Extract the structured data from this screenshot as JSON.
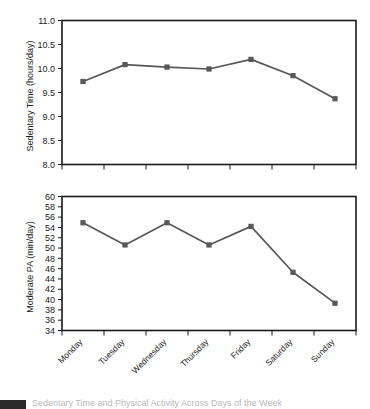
{
  "figure": {
    "caption_fragment": "Sedentary Time and Physical Activity Across Days of the Week"
  },
  "chart_data": [
    {
      "type": "line",
      "title": "",
      "xlabel": "",
      "ylabel": "Sedentary Time (hours/day)",
      "categories": [
        "Monday",
        "Tuesday",
        "Wednesday",
        "Thursday",
        "Friday",
        "Saturday",
        "Sunday"
      ],
      "values": [
        9.73,
        10.08,
        10.03,
        9.99,
        10.19,
        9.85,
        9.37
      ],
      "ylim": [
        8.0,
        11.0
      ],
      "yticks": [
        "8.0",
        "8.5",
        "9.0",
        "9.5",
        "10.0",
        "10.5",
        "11.0"
      ],
      "ytick_values": [
        8.0,
        8.5,
        9.0,
        9.5,
        10.0,
        10.5,
        11.0
      ],
      "grid": false,
      "legend": false,
      "series_color": "#585858",
      "marker": "square"
    },
    {
      "type": "line",
      "title": "",
      "xlabel": "",
      "ylabel": "Moderate PA (min/day)",
      "categories": [
        "Monday",
        "Tuesday",
        "Wednesday",
        "Thursday",
        "Friday",
        "Saturday",
        "Sunday"
      ],
      "values": [
        54.9,
        50.6,
        54.9,
        50.6,
        54.2,
        45.3,
        39.3
      ],
      "ylim": [
        34,
        60
      ],
      "yticks": [
        "34",
        "36",
        "38",
        "40",
        "42",
        "44",
        "46",
        "48",
        "50",
        "52",
        "54",
        "56",
        "58",
        "60"
      ],
      "ytick_values": [
        34,
        36,
        38,
        40,
        42,
        44,
        46,
        48,
        50,
        52,
        54,
        56,
        58,
        60
      ],
      "grid": false,
      "legend": false,
      "series_color": "#585858",
      "marker": "square"
    }
  ]
}
